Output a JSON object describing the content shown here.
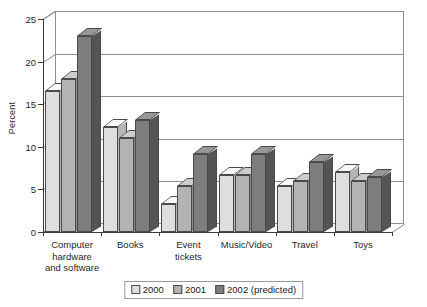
{
  "chart_data": {
    "type": "bar",
    "title": "",
    "subtitle": "",
    "xlabel": "",
    "ylabel": "Percent",
    "ylim": [
      0,
      25
    ],
    "yticks": [
      0,
      5,
      10,
      15,
      20,
      25
    ],
    "grid": true,
    "legend_position": "bottom",
    "style": "3d-grouped-columns",
    "categories": [
      "Computer\nhardware\nand software",
      "Books",
      "Event\ntickets",
      "Music/Video",
      "Travel",
      "Toys"
    ],
    "series": [
      {
        "name": "2000",
        "color": "#dedede",
        "values": [
          16.5,
          12.3,
          3.3,
          6.7,
          5.4,
          7.0
        ]
      },
      {
        "name": "2001",
        "color": "#b3b3b3",
        "values": [
          18.0,
          11.0,
          5.4,
          6.7,
          6.0,
          6.0
        ]
      },
      {
        "name": "2002 (predicted)",
        "color": "#7d7d7d",
        "values": [
          23.0,
          13.2,
          9.2,
          9.2,
          8.2,
          6.5
        ]
      }
    ]
  },
  "axis": {
    "y_label": "Percent",
    "y_tick_labels": [
      "0",
      "5",
      "10",
      "15",
      "20",
      "25"
    ]
  },
  "legend": {
    "items": [
      {
        "label": "2000"
      },
      {
        "label": "2001"
      },
      {
        "label": "2002 (predicted)"
      }
    ]
  },
  "colors": {
    "series_2000": "#dedede",
    "series_2001": "#b3b3b3",
    "series_2002": "#7d7d7d",
    "axis": "#3a3a3a",
    "grid": "#8e8e8e",
    "outline": "#4a4a4a",
    "text": "#1f1f1f",
    "background": "#ffffff"
  }
}
